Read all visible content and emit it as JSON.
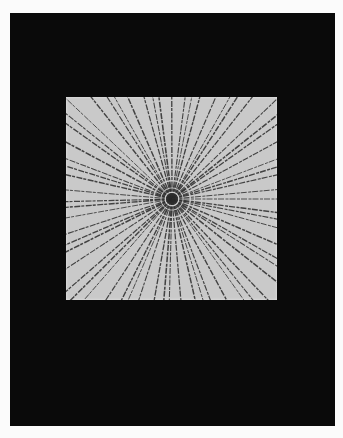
{
  "image": {
    "description": "Photograph of a square radial line drawing on a black background",
    "artwork": {
      "subject": "radiating lines from center",
      "line_count": 64,
      "paper_color": "#c9c9c9",
      "line_color": "#2a2a2a"
    },
    "background_color": "#0a0a0a",
    "border_color": "#fbfbfb"
  }
}
